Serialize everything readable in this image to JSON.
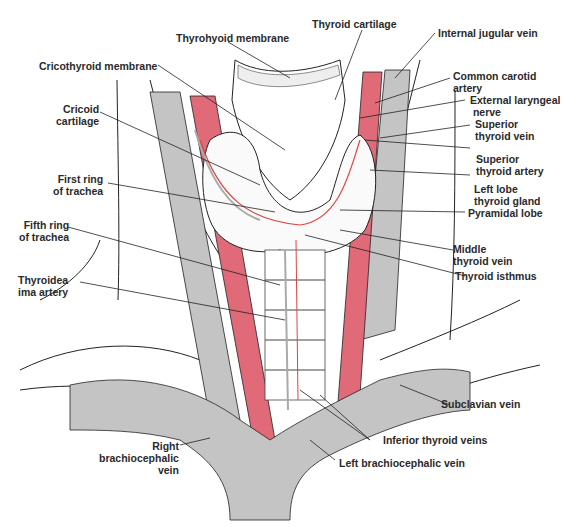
{
  "figure": {
    "colors": {
      "artery": "#e06a78",
      "vein": "#c4c4c4",
      "outline": "#222222",
      "background": "#ffffff"
    },
    "labels": {
      "thyrohyoid_membrane": "Thyrohyoid membrane",
      "thyroid_cartilage": "Thyroid cartilage",
      "internal_jugular_vein": "Internal jugular vein",
      "cricothyroid_membrane": "Cricothyroid membrane",
      "common_carotid_artery": "Common carotid\nartery",
      "external_laryngeal_nerve": "External laryngeal\n nerve",
      "cricoid_cartilage": "Cricoid\ncartilage",
      "superior_thyroid_vein": "Superior\nthyroid vein",
      "superior_thyroid_artery": "Superior\nthyroid artery",
      "first_ring_of_trachea": "First ring\nof trachea",
      "left_lobe_thyroid_gland": "Left lobe\nthyroid gland",
      "pyramidal_lobe": "Pyramidal lobe",
      "fifth_ring_of_trachea": "Fifth ring\nof trachea",
      "middle_thyroid_vein": "Middle\nthyroid vein",
      "thyroid_isthmus": "Thyroid isthmus",
      "thyroidea_ima_artery": "Thyroidea\nima artery",
      "subclavian_vein": "Subclavian vein",
      "inferior_thyroid_veins": "Inferior thyroid veins",
      "right_brachiocephalic_vein": "Right\nbrachiocephalic\nvein",
      "left_brachiocephalic_vein": "Left brachiocephalic vein"
    }
  }
}
